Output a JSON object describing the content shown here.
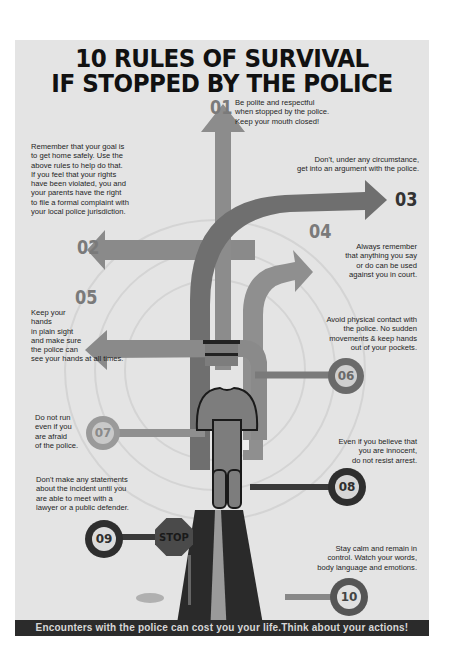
{
  "title": {
    "line1": "10 RULES OF SURVIVAL",
    "line2": "IF STOPPED BY THE POLICE"
  },
  "rules": [
    {
      "number": "01",
      "text": [
        "Be polite and respectful",
        "when stopped by the police.",
        "Keep your mouth closed!"
      ]
    },
    {
      "number": "02",
      "text": []
    },
    {
      "number": "03",
      "text": [
        "Don't, under any circumstance,",
        "get into an argument with the police."
      ]
    },
    {
      "number": "04",
      "text": [
        "Always remember",
        "that anything you say",
        "or do can be used",
        "against you in court."
      ]
    },
    {
      "number": "05",
      "text": [
        "Keep your",
        "hands",
        "in plain sight",
        "and make sure",
        "the police can",
        "see your hands at all times."
      ]
    },
    {
      "number": "06",
      "text": [
        "Avoid physical contact with",
        "the police. No sudden",
        "movements & keep hands",
        "out of your pockets."
      ]
    },
    {
      "number": "07",
      "text": [
        "Do not run",
        "even if you",
        "are afraid",
        "of the police."
      ]
    },
    {
      "number": "08",
      "text": [
        "Even if you believe that",
        "you are innocent,",
        "do not resist arrest."
      ]
    },
    {
      "number": "09",
      "text": [
        "Don't make any statements",
        "about the incident until you",
        "are able to meet with a",
        "lawyer or a public defender."
      ]
    },
    {
      "number": "10",
      "text": [
        "Stay calm and remain in",
        "control. Watch your words,",
        "body language and emotions."
      ]
    }
  ],
  "rule02_text": [
    "Remember that your goal is",
    "to get home safely. Use the",
    "above rules to help do that.",
    "If you feel that your rights",
    "have been violated, you and",
    "your parents have the right",
    "to file a formal complaint with",
    "your local police jurisdiction."
  ],
  "stop_sign": "STOP",
  "footer": "Encounters with the police can cost you your life.Think about your actions!",
  "colors": {
    "background": "#e4e4e4",
    "arrow": "#8a8a8a",
    "dark": "#2e2e2e",
    "figure": "#7d7d7d"
  }
}
